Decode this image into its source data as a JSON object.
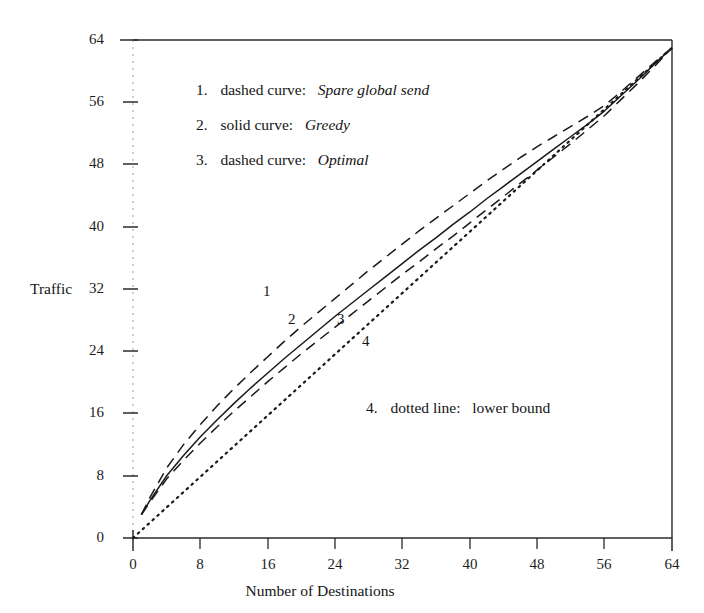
{
  "figure": {
    "background_color": "#ffffff",
    "ink_color": "#1a1a1a"
  },
  "axes": {
    "y_axis_title": "Traffic",
    "x_axis_title": "Number of Destinations",
    "y_ticks": [
      "0",
      "8",
      "16",
      "24",
      "32",
      "40",
      "48",
      "56",
      "64"
    ],
    "x_ticks": [
      "0",
      "8",
      "16",
      "24",
      "32",
      "40",
      "48",
      "56",
      "64"
    ]
  },
  "legend": {
    "items": [
      {
        "number": "1.",
        "style_text": "dashed curve:",
        "name": "Spare global send"
      },
      {
        "number": "2.",
        "style_text": "solid curve:",
        "name": "Greedy"
      },
      {
        "number": "3.",
        "style_text": "dashed curve:",
        "name": "Optimal"
      }
    ],
    "note": {
      "number": "4.",
      "style_text": "dotted line:",
      "name": "lower bound"
    }
  },
  "curve_labels": {
    "one": "1",
    "two": "2",
    "three": "3",
    "four": "4"
  },
  "chart_data": {
    "type": "line",
    "title": "",
    "xlabel": "Number of Destinations",
    "ylabel": "Traffic",
    "xlim": [
      0,
      64
    ],
    "ylim": [
      0,
      64
    ],
    "xticks": [
      0,
      8,
      16,
      24,
      32,
      40,
      48,
      56,
      64
    ],
    "yticks": [
      0,
      8,
      16,
      24,
      32,
      40,
      48,
      56,
      64
    ],
    "grid": false,
    "legend_position": "inside-upper-left",
    "series": [
      {
        "name": "Spare global send",
        "label_number": "1",
        "line_style": "dashed",
        "x": [
          1,
          2,
          4,
          6,
          8,
          10,
          12,
          14,
          16,
          18,
          20,
          22,
          24,
          26,
          28,
          30,
          32,
          34,
          36,
          38,
          40,
          42,
          44,
          46,
          48,
          50,
          52,
          54,
          56,
          58,
          60,
          62,
          64
        ],
        "y": [
          3.0,
          5.2,
          9.0,
          12.0,
          14.6,
          17.0,
          19.2,
          21.3,
          23.3,
          25.3,
          27.2,
          29.0,
          30.8,
          32.6,
          34.4,
          36.1,
          37.8,
          39.5,
          41.1,
          42.7,
          44.3,
          45.9,
          47.4,
          48.9,
          50.3,
          51.6,
          52.9,
          54.2,
          55.6,
          57.4,
          59.3,
          61.2,
          63.0
        ]
      },
      {
        "name": "Greedy",
        "label_number": "2",
        "line_style": "solid",
        "x": [
          1,
          2,
          4,
          6,
          8,
          10,
          12,
          14,
          16,
          18,
          20,
          22,
          24,
          26,
          28,
          30,
          32,
          34,
          36,
          38,
          40,
          42,
          44,
          46,
          48,
          50,
          52,
          54,
          56,
          58,
          60,
          62,
          64
        ],
        "y": [
          3.0,
          4.8,
          8.0,
          10.6,
          13.0,
          15.2,
          17.3,
          19.3,
          21.2,
          23.1,
          24.9,
          26.7,
          28.5,
          30.2,
          31.9,
          33.6,
          35.3,
          37.0,
          38.6,
          40.3,
          41.9,
          43.6,
          45.2,
          46.8,
          48.4,
          50.0,
          51.6,
          53.2,
          54.9,
          56.9,
          58.9,
          61.0,
          63.0
        ]
      },
      {
        "name": "Optimal",
        "label_number": "3",
        "line_style": "dashed",
        "x": [
          1,
          2,
          4,
          6,
          8,
          10,
          12,
          14,
          16,
          18,
          20,
          22,
          24,
          26,
          28,
          30,
          32,
          34,
          36,
          38,
          40,
          42,
          44,
          46,
          48,
          50,
          52,
          54,
          56,
          58,
          60,
          62,
          64
        ],
        "y": [
          3.0,
          4.6,
          7.6,
          10.0,
          12.2,
          14.3,
          16.3,
          18.2,
          20.1,
          21.9,
          23.7,
          25.4,
          27.1,
          28.8,
          30.5,
          32.2,
          33.9,
          35.5,
          37.2,
          38.8,
          40.5,
          42.2,
          43.9,
          45.6,
          47.3,
          49.0,
          50.7,
          52.5,
          54.3,
          56.4,
          58.5,
          60.7,
          63.0
        ]
      },
      {
        "name": "lower bound",
        "label_number": "4",
        "line_style": "dotted",
        "x": [
          0,
          64
        ],
        "y": [
          0,
          63.0
        ]
      }
    ]
  }
}
